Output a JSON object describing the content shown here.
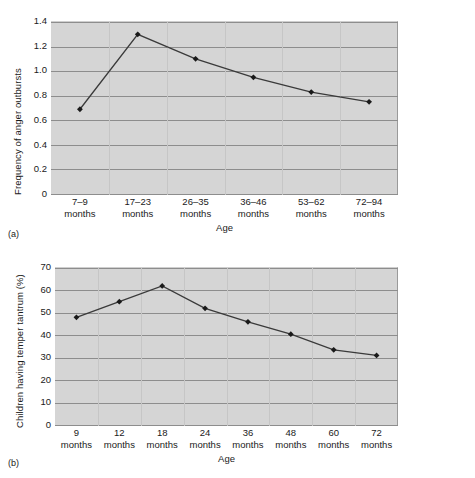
{
  "figures": [
    {
      "panel_label": "(a)",
      "ylabel": "Frequency of anger outbursts",
      "xlabel": "Age",
      "yticks": [
        "1.4",
        "1.2",
        "1.0",
        "0.8",
        "0.6",
        "0.4",
        "0.2",
        "0"
      ],
      "xticks": [
        {
          "line1": "7–9",
          "line2": "months"
        },
        {
          "line1": "17–23",
          "line2": "months"
        },
        {
          "line1": "26–35",
          "line2": "months"
        },
        {
          "line1": "36–46",
          "line2": "months"
        },
        {
          "line1": "53–62",
          "line2": "months"
        },
        {
          "line1": "72–94",
          "line2": "months"
        }
      ]
    },
    {
      "panel_label": "(b)",
      "ylabel": "Children having temper tantrum (%)",
      "xlabel": "Age",
      "yticks": [
        "70",
        "60",
        "50",
        "40",
        "30",
        "20",
        "10",
        "0"
      ],
      "xticks": [
        {
          "line1": "9",
          "line2": "months"
        },
        {
          "line1": "12",
          "line2": "months"
        },
        {
          "line1": "18",
          "line2": "months"
        },
        {
          "line1": "24",
          "line2": "months"
        },
        {
          "line1": "36",
          "line2": "months"
        },
        {
          "line1": "48",
          "line2": "months"
        },
        {
          "line1": "60",
          "line2": "months"
        },
        {
          "line1": "72",
          "line2": "months"
        }
      ]
    }
  ],
  "colors": {
    "plot_background": "#d5d5d5",
    "gridline": "#8d8d8d",
    "series_line": "#3a3a3a",
    "marker": "#1a1a1a",
    "page_background": "#ffffff",
    "text": "#1a1a1a"
  },
  "chart_data": [
    {
      "type": "line",
      "panel": "(a)",
      "title": "",
      "xlabel": "Age",
      "ylabel": "Frequency of anger outbursts",
      "categories": [
        "7–9 months",
        "17–23 months",
        "26–35 months",
        "36–46 months",
        "53–62 months",
        "72–94 months"
      ],
      "values": [
        0.69,
        1.3,
        1.1,
        0.95,
        0.83,
        0.75
      ],
      "ylim": [
        0,
        1.4
      ],
      "ytick_values": [
        0,
        0.2,
        0.4,
        0.6,
        0.8,
        1.0,
        1.2,
        1.4
      ],
      "grid": "horizontal",
      "legend": "none",
      "markers": "diamond"
    },
    {
      "type": "line",
      "panel": "(b)",
      "title": "",
      "xlabel": "Age",
      "ylabel": "Children having temper tantrum (%)",
      "categories": [
        "9 months",
        "12 months",
        "18 months",
        "24 months",
        "36 months",
        "48 months",
        "60 months",
        "72 months"
      ],
      "values": [
        48,
        55,
        62,
        52,
        46,
        40.5,
        33.5,
        31
      ],
      "ylim": [
        0,
        70
      ],
      "ytick_values": [
        0,
        10,
        20,
        30,
        40,
        50,
        60,
        70
      ],
      "grid": "horizontal",
      "legend": "none",
      "markers": "diamond"
    }
  ]
}
